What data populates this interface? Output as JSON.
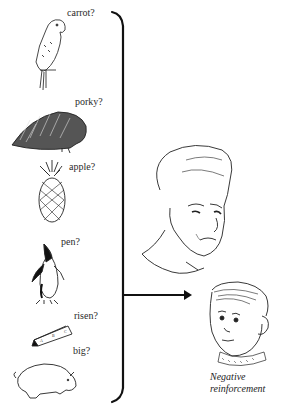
{
  "figure": {
    "items": [
      {
        "picture": "parrot",
        "label": "carrot?"
      },
      {
        "picture": "porcupine",
        "label": "porky?"
      },
      {
        "picture": "pineapple",
        "label": "apple?"
      },
      {
        "picture": "penguin",
        "label": "pen?"
      },
      {
        "picture": "prism",
        "label": "risen?"
      },
      {
        "picture": "pig",
        "label": "big?"
      }
    ],
    "adult": "woman-frowning",
    "child": "boy-sad",
    "caption": {
      "line1": "Negative",
      "line2": "reinforcement"
    }
  }
}
